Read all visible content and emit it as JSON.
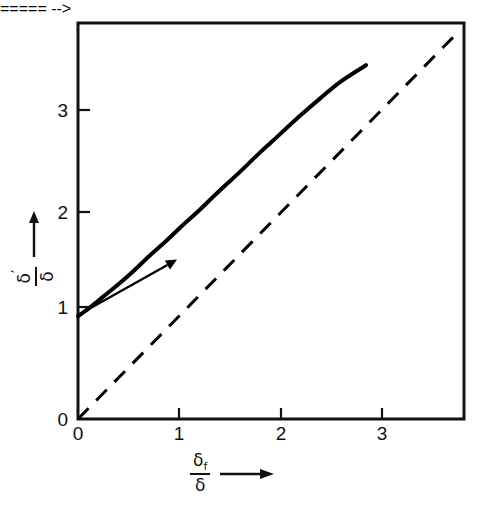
{
  "figure": {
    "width": 484,
    "height": 509,
    "background": "#ffffff",
    "line_color": "#000000"
  },
  "axes": {
    "frame": {
      "left": 78,
      "top": 23,
      "right": 464,
      "bottom": 419
    },
    "x": {
      "label_numerator": "δ",
      "label_numerator_sub": "f",
      "label_denominator": "δ",
      "arrow": "right-arrow-icon",
      "ticks": [
        {
          "value": 0,
          "label": "0",
          "px": 78
        },
        {
          "value": 1,
          "label": "1",
          "px": 179
        },
        {
          "value": 2,
          "label": "2",
          "px": 281
        },
        {
          "value": 3,
          "label": "3",
          "px": 382
        }
      ],
      "min": 0,
      "max": 3.82
    },
    "y": {
      "label_numerator": "δ",
      "label_numerator_prime": "′",
      "label_denominator": "δ",
      "arrow": "up-arrow-icon",
      "ticks": [
        {
          "value": 0,
          "label": "0",
          "px": 419
        },
        {
          "value": 1,
          "label": "1",
          "px": 307
        },
        {
          "value": 2,
          "label": "2",
          "px": 212
        },
        {
          "value": 3,
          "label": "3",
          "px": 110
        }
      ],
      "min": 0,
      "max": 3.85
    }
  },
  "chart_data": {
    "type": "line",
    "title": "",
    "xlabel": "δf/δ",
    "ylabel": "δ'/δ",
    "xlim": [
      0,
      3.82
    ],
    "ylim": [
      0,
      3.85
    ],
    "grid": false,
    "legend": "none",
    "series": [
      {
        "name": "solid-curve",
        "style": "solid",
        "width": 4,
        "color": "#000000",
        "x": [
          0.0,
          0.1,
          0.2,
          0.3,
          0.4,
          0.55,
          0.7,
          0.85,
          1.0,
          1.2,
          1.4,
          1.6,
          1.8,
          2.0,
          2.2,
          2.4,
          2.6,
          2.85
        ],
        "y": [
          1.0,
          1.07,
          1.15,
          1.23,
          1.31,
          1.44,
          1.58,
          1.71,
          1.85,
          2.03,
          2.22,
          2.4,
          2.59,
          2.77,
          2.95,
          3.12,
          3.28,
          3.44
        ]
      },
      {
        "name": "identity-dashed-line",
        "style": "dashed",
        "width": 3,
        "color": "#000000",
        "x": [
          0.0,
          3.72
        ],
        "y": [
          0.0,
          3.72
        ]
      }
    ],
    "annotations": [
      {
        "name": "direction-arrow",
        "type": "arrow",
        "from": [
          0.02,
          1.02
        ],
        "to": [
          0.98,
          1.55
        ]
      }
    ]
  }
}
